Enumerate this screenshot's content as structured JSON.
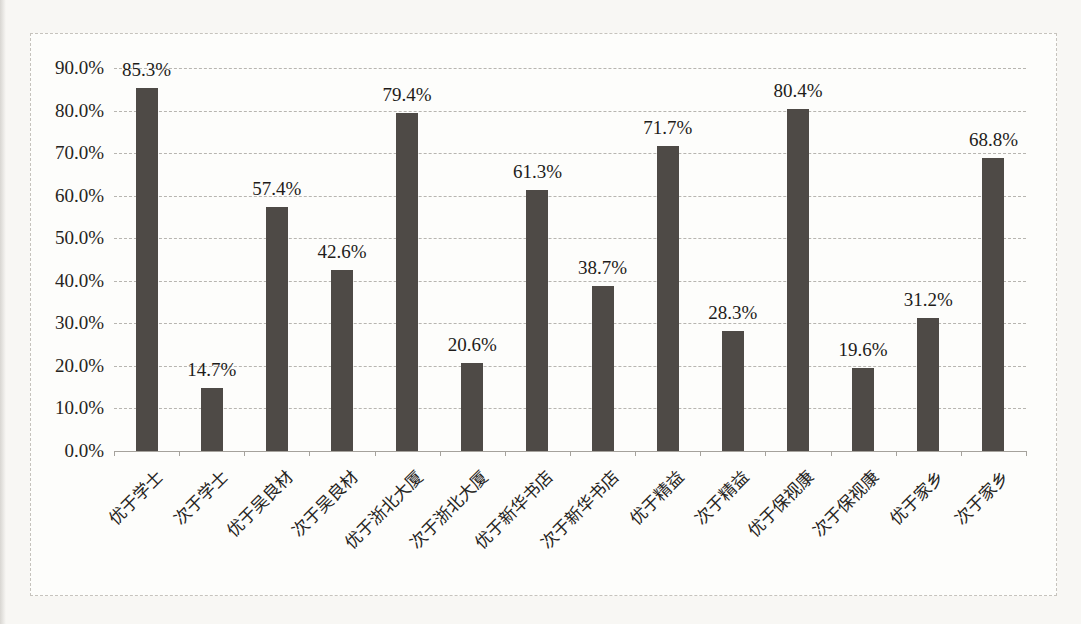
{
  "chart_data": {
    "type": "bar",
    "title": "",
    "xlabel": "",
    "ylabel": "",
    "legend": "none",
    "grid": "horizontal-dashed",
    "ylim": [
      0,
      90
    ],
    "y_tick_labels": [
      "0.0%",
      "10.0%",
      "20.0%",
      "30.0%",
      "40.0%",
      "50.0%",
      "60.0%",
      "70.0%",
      "80.0%",
      "90.0%"
    ],
    "categories": [
      "优于学士",
      "次于学士",
      "优于吴良材",
      "次于吴良材",
      "优于浙北大厦",
      "次于浙北大厦",
      "优于新华书店",
      "次于新华书店",
      "优于精益",
      "次于精益",
      "优于保视康",
      "次于保视康",
      "优于家乡",
      "次于家乡"
    ],
    "values": [
      85.3,
      14.7,
      57.4,
      42.6,
      79.4,
      20.6,
      61.3,
      38.7,
      71.7,
      28.3,
      80.4,
      19.6,
      31.2,
      68.8
    ],
    "data_labels": [
      "85.3%",
      "14.7%",
      "57.4%",
      "42.6%",
      "79.4%",
      "20.6%",
      "61.3%",
      "38.7%",
      "71.7%",
      "28.3%",
      "80.4%",
      "19.6%",
      "31.2%",
      "68.8%"
    ],
    "bar_color": "#4e4a46",
    "gridline_color": "#b7b5b0",
    "axis_color": "#a5a29c",
    "frame_border_color": "#c6c3bd",
    "background_color": "#fdfdfb"
  }
}
